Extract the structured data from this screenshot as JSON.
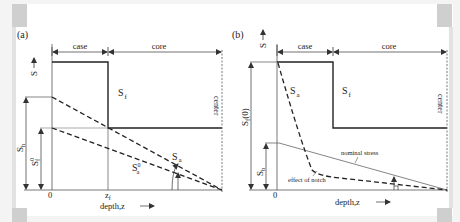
{
  "panel_a": {
    "label": "(a)",
    "case_label": "case",
    "core_label": "core",
    "s_axis_label": "S",
    "s_axis_arrow": "→",
    "sf_label": "S",
    "sf_sub": "f",
    "sh_label": "S",
    "sh_sub": "h",
    "sf0_label": "S",
    "sf0_sub": "f",
    "sf0_sup": "0",
    "sa_label": "S",
    "sa_sub": "a",
    "sa0_label": "S",
    "sa0_sub": "a",
    "sa0_sup": "0",
    "zero_label": "0",
    "zf_label": "z",
    "zf_sub": "f",
    "depth_label": "depth,z",
    "depth_arrow": "⟶",
    "center_label": "center"
  },
  "panel_b": {
    "label": "(b)",
    "case_label": "case",
    "core_label": "core",
    "s_axis_label": "S",
    "s_axis_arrow": "→",
    "sf_label": "S",
    "sf_sub": "f",
    "sf0_label": "S",
    "sf0_sub": "f",
    "sf0_tail": "(0)",
    "sb_label": "S",
    "sb_sub": "b",
    "sa_label": "S",
    "sa_sub": "a",
    "nominal_label": "nominal stress",
    "notch_label": "effect of notch",
    "zero_label": "0",
    "depth_label": "depth,z",
    "depth_arrow": "⟶",
    "center_label": "center"
  }
}
